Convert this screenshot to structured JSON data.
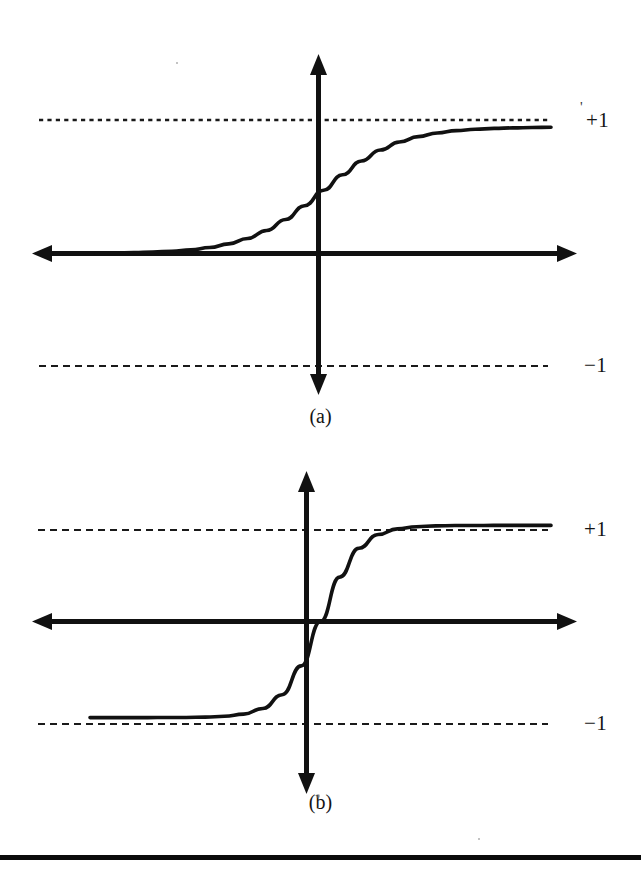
{
  "figure": {
    "background_color": "#ffffff",
    "ink_color": "#111111",
    "width": 641,
    "height": 874,
    "footer_rule_present": true
  },
  "panels": [
    {
      "id": "a",
      "caption": "(a)",
      "upper_label": "+1",
      "lower_label": "−1",
      "stray_mark": "'"
    },
    {
      "id": "b",
      "caption": "(b)",
      "upper_label": "+1",
      "lower_label": "−1",
      "stray_mark": ""
    }
  ],
  "chart_data": [
    {
      "type": "line",
      "id": "panel-a-logistic-sigmoid",
      "title": "(a)",
      "xlabel": "",
      "ylabel": "",
      "xlim": [
        -6,
        6
      ],
      "ylim": [
        -1.35,
        1.45
      ],
      "grid": false,
      "legend": null,
      "axis_style": "double-headed arrows through origin",
      "annotations": [
        "+1",
        "−1"
      ],
      "tick_labels": {
        "y": [
          "+1",
          "−1"
        ]
      },
      "asymptotes": [
        {
          "value": 1,
          "label": "+1",
          "style": "dashed"
        },
        {
          "value": -1,
          "label": "−1",
          "style": "dashed"
        }
      ],
      "series": [
        {
          "name": "logistic sigmoid",
          "x": [
            -6.0,
            -5.5,
            -5.0,
            -4.5,
            -4.0,
            -3.5,
            -3.0,
            -2.5,
            -2.0,
            -1.5,
            -1.0,
            -0.5,
            0.0,
            0.5,
            1.0,
            1.5,
            2.0,
            2.5,
            3.0,
            3.5,
            4.0,
            4.5,
            5.0,
            5.5,
            6.0
          ],
          "y": [
            0.002,
            0.004,
            0.007,
            0.011,
            0.018,
            0.029,
            0.047,
            0.076,
            0.119,
            0.182,
            0.269,
            0.378,
            0.5,
            0.622,
            0.731,
            0.818,
            0.881,
            0.924,
            0.953,
            0.971,
            0.982,
            0.989,
            0.993,
            0.996,
            0.998
          ]
        }
      ]
    },
    {
      "type": "line",
      "id": "panel-b-hyperbolic-tangent",
      "title": "(b)",
      "xlabel": "",
      "ylabel": "",
      "xlim": [
        -6,
        6
      ],
      "ylim": [
        -1.55,
        1.55
      ],
      "grid": false,
      "legend": null,
      "axis_style": "double-headed arrows through origin",
      "annotations": [
        "+1",
        "−1"
      ],
      "tick_labels": {
        "y": [
          "+1",
          "−1"
        ]
      },
      "asymptotes": [
        {
          "value": 1,
          "label": "+1",
          "style": "dashed"
        },
        {
          "value": -1,
          "label": "−1",
          "style": "dashed"
        }
      ],
      "series": [
        {
          "name": "hyperbolic tangent",
          "x": [
            -6.0,
            -5.5,
            -5.0,
            -4.5,
            -4.0,
            -3.5,
            -3.0,
            -2.5,
            -2.0,
            -1.5,
            -1.0,
            -0.5,
            0.0,
            0.5,
            1.0,
            1.5,
            2.0,
            2.5,
            3.0,
            3.5,
            4.0,
            4.5,
            5.0,
            5.5,
            6.0
          ],
          "y": [
            -1.0,
            -0.9999,
            -0.9999,
            -0.9998,
            -0.9993,
            -0.9982,
            -0.995,
            -0.9866,
            -0.964,
            -0.905,
            -0.762,
            -0.462,
            0.0,
            0.462,
            0.762,
            0.905,
            0.964,
            0.9866,
            0.995,
            0.9982,
            0.9993,
            0.9998,
            0.9999,
            0.9999,
            1.0
          ]
        }
      ]
    }
  ]
}
